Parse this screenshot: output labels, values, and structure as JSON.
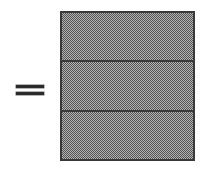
{
  "diagram": {
    "equals": {
      "symbol": "=",
      "name": "equals-sign",
      "bar_count": 2,
      "color": "#2b2b2b"
    },
    "bar_model": {
      "name": "segmented-bar",
      "segment_count": 3,
      "divider_count": 2,
      "fill_pattern": "50-percent-checkerboard-dither",
      "fill_colors": [
        "#555555",
        "#b2b2b2"
      ],
      "border_color": "#3a3a3a",
      "segments": [
        {
          "label": "",
          "index": 1
        },
        {
          "label": "",
          "index": 2
        },
        {
          "label": "",
          "index": 3
        }
      ]
    },
    "background_color": "#ffffff"
  }
}
